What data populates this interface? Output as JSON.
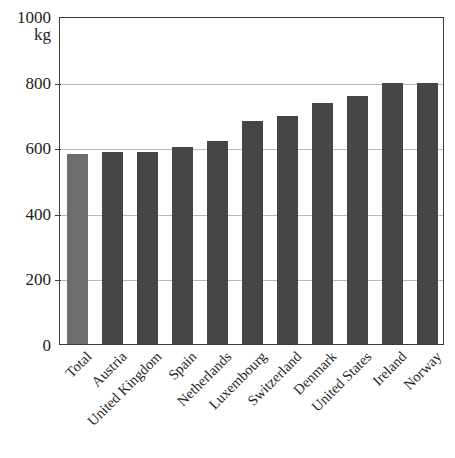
{
  "chart_data": {
    "type": "bar",
    "title": "",
    "subtitle": "",
    "xlabel": "",
    "ylabel": "",
    "unit_label": "kg",
    "ylim": [
      0,
      1000
    ],
    "yticks": [
      0,
      200,
      400,
      600,
      800,
      1000
    ],
    "ytick_labels": [
      "0",
      "200",
      "400",
      "600",
      "800",
      "1000"
    ],
    "grid": true,
    "grid_axis": "y",
    "legend": null,
    "categories": [
      "Total",
      "Austria",
      "United Kingdom",
      "Spain",
      "Netherlands",
      "Luxembourg",
      "Switzerland",
      "Denmark",
      "United States",
      "Ireland",
      "Norway"
    ],
    "values": [
      580,
      585,
      585,
      600,
      620,
      680,
      695,
      735,
      757,
      795,
      795
    ],
    "colors": {
      "bar": "#464646",
      "bar_total": "#6d6d6d",
      "frame": "#3a3a3a",
      "gridline": "#b9b9b9",
      "background": "#ffffff",
      "text": "#1d1d1d"
    },
    "highlight_category": "Total"
  }
}
